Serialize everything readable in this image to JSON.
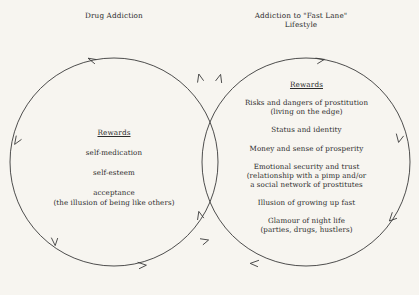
{
  "figure": {
    "type": "venn-cycle-diagram",
    "background_color": "#f7f5f0",
    "stroke_color": "#3a3a3a"
  },
  "headings": {
    "left": {
      "line1": "Drug Addiction",
      "line2": ""
    },
    "right": {
      "line1": "Addiction to \"Fast Lane\"",
      "line2": "Lifestyle"
    }
  },
  "left_circle": {
    "rewards_label": "Rewards",
    "flow_direction": "counter-clockwise",
    "items": [
      {
        "main": "self-medication",
        "sub": ""
      },
      {
        "main": "self-esteem",
        "sub": ""
      },
      {
        "main": "acceptance",
        "sub": "(the illusion of being like others)"
      }
    ]
  },
  "right_circle": {
    "rewards_label": "Rewards",
    "flow_direction": "clockwise",
    "items": [
      {
        "main": "Risks and dangers of prostitution",
        "sub": "(living on the edge)"
      },
      {
        "main": "Status and identity",
        "sub": ""
      },
      {
        "main": "Money and sense of prosperity",
        "sub": ""
      },
      {
        "main": "Emotional security and trust",
        "sub": "(relationship with a pimp and/or",
        "sub2": "a social network of prostitutes"
      },
      {
        "main": "Illusion of growing up fast",
        "sub": ""
      },
      {
        "main": "Glamour of night life",
        "sub": "(parties, drugs, hustlers)"
      }
    ]
  }
}
